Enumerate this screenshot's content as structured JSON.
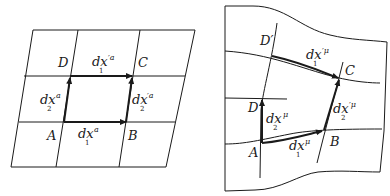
{
  "left_panel": {
    "title": "flat grid",
    "points": {
      "A": "A",
      "B": "B",
      "C": "C",
      "D": "D"
    },
    "vectors": {
      "dx1": {
        "base": "dx",
        "sup": "a",
        "sub": "1"
      },
      "dx2": {
        "base": "dx",
        "sup": "a",
        "sub": "2"
      },
      "dx1p": {
        "base": "dx",
        "sup": "′a",
        "sub": "1"
      },
      "dx2p": {
        "base": "dx",
        "sup": "′a",
        "sub": "2"
      }
    }
  },
  "right_panel": {
    "title": "curved grid",
    "points": {
      "A": "A",
      "B": "B",
      "C": "C",
      "D": "D",
      "Dp": "D′"
    },
    "vectors": {
      "dx1": {
        "base": "dx",
        "sup": "μ",
        "sub": "1"
      },
      "dx2": {
        "base": "dx",
        "sup": "μ",
        "sub": "2"
      },
      "dx1p": {
        "base": "dx",
        "sup": "′μ",
        "sub": "1"
      },
      "dx2p": {
        "base": "dx",
        "sup": "′μ",
        "sub": "2"
      }
    }
  },
  "colors": {
    "line": "#1a1a1a",
    "background": "#ffffff"
  }
}
